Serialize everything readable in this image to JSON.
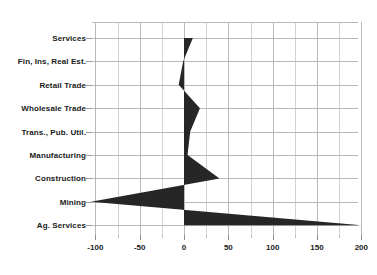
{
  "chart_data": {
    "type": "area",
    "title": "",
    "subtitle": "",
    "xlabel": "",
    "ylabel": "",
    "orientation": "horizontal",
    "grid": true,
    "legend": false,
    "legend_position": "none",
    "xlim": [
      -110,
      205
    ],
    "xticks": [
      -100,
      -50,
      0,
      50,
      100,
      150,
      200
    ],
    "xtick_labels": [
      "-100",
      "-50",
      "0",
      "50",
      "100",
      "150",
      "200"
    ],
    "xticks_minor": [
      -75,
      -25,
      25,
      75,
      125,
      175
    ],
    "zero_reference": 0,
    "series_color": "#262626",
    "grid_color": "#b8b8b8",
    "categories": [
      "Services",
      "Fin, Ins, Real Est.",
      "Retail Trade",
      "Wholesale Trade",
      "Trans., Pub. Util.",
      "Manufacturing",
      "Construction",
      "Mining",
      "Ag. Services"
    ],
    "values": [
      10,
      -1,
      -6,
      18,
      7,
      4,
      40,
      -105,
      200
    ],
    "series": [
      {
        "name": "Value",
        "values": [
          10,
          -1,
          -6,
          18,
          7,
          4,
          40,
          -105,
          200
        ]
      }
    ]
  },
  "axis": {
    "x_tick_labels": [
      "-100",
      "-50",
      "0",
      "50",
      "100",
      "150",
      "200"
    ],
    "y_tick_labels": [
      "Services",
      "Fin, Ins, Real Est.",
      "Retail Trade",
      "Wholesale Trade",
      "Trans., Pub. Util.",
      "Manufacturing",
      "Construction",
      "Mining",
      "Ag. Services"
    ]
  }
}
